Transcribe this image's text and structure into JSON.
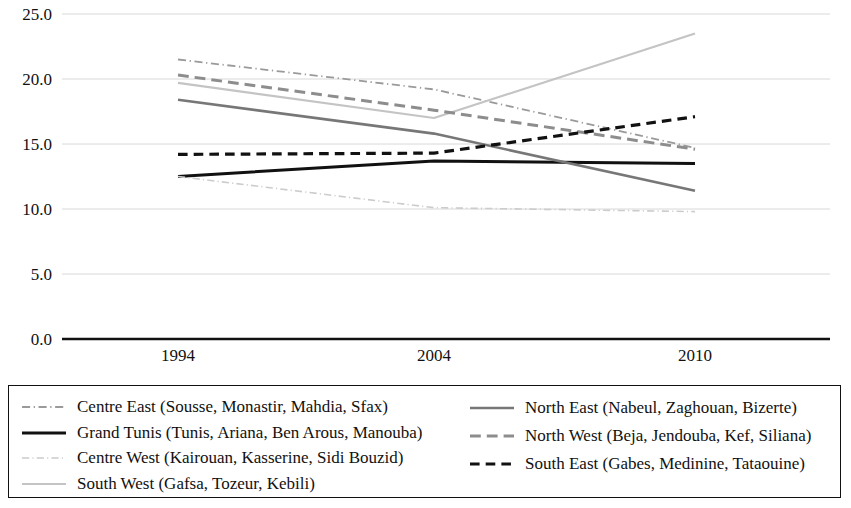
{
  "chart_data": {
    "type": "line",
    "title": "",
    "subtitle": "",
    "xlabel": "",
    "ylabel": "",
    "x": [
      "1994",
      "2004",
      "2010"
    ],
    "categories": [
      "1994",
      "2004",
      "2010"
    ],
    "xtick_labels": [
      "1994",
      "2004",
      "2010"
    ],
    "ytick_labels": [
      "0.0",
      "5.0",
      "10.0",
      "15.0",
      "20.0",
      "25.0"
    ],
    "yticks": [
      0.0,
      5.0,
      10.0,
      15.0,
      20.0,
      25.0
    ],
    "ylim": [
      0.0,
      25.0
    ],
    "grid": true,
    "grid_axis": "y",
    "legend_position": "bottom",
    "legend_columns": 2,
    "series": [
      {
        "name": "Centre East (Sousse, Monastir, Mahdia, Sfax)",
        "short_name": "Centre East",
        "values": [
          21.5,
          19.2,
          14.7
        ],
        "style": "dash-dot",
        "color": "#9a9a9a",
        "width": 1.8
      },
      {
        "name": "Grand Tunis (Tunis, Ariana, Ben Arous, Manouba)",
        "short_name": "Grand Tunis",
        "values": [
          12.5,
          13.7,
          13.5
        ],
        "style": "solid",
        "color": "#111111",
        "width": 3.0
      },
      {
        "name": "Centre West (Kairouan, Kasserine, Sidi Bouzid)",
        "short_name": "Centre West",
        "values": [
          12.5,
          10.1,
          9.8
        ],
        "style": "dash-dot",
        "color": "#cccccc",
        "width": 1.6
      },
      {
        "name": "South West (Gafsa, Tozeur, Kebili)",
        "short_name": "South West",
        "values": [
          19.7,
          17.0,
          23.5
        ],
        "style": "solid",
        "color": "#c4c4c4",
        "width": 2.2
      },
      {
        "name": "North East (Nabeul, Zaghouan, Bizerte)",
        "short_name": "North East",
        "values": [
          18.4,
          15.8,
          11.4
        ],
        "style": "solid",
        "color": "#777777",
        "width": 2.6
      },
      {
        "name": "North West (Beja, Jendouba, Kef, Siliana)",
        "short_name": "North West",
        "values": [
          20.3,
          17.6,
          14.6
        ],
        "style": "long-dash",
        "color": "#8d8d8d",
        "width": 3.0
      },
      {
        "name": "South East (Gabes, Medinine, Tataouine)",
        "short_name": "South East",
        "values": [
          14.2,
          14.3,
          17.1
        ],
        "style": "dashed",
        "color": "#111111",
        "width": 3.2
      }
    ]
  },
  "legend": {
    "left_items": [
      "Centre East (Sousse, Monastir, Mahdia, Sfax)",
      "Grand Tunis (Tunis, Ariana, Ben Arous, Manouba)",
      "Centre West (Kairouan, Kasserine, Sidi Bouzid)",
      "South West (Gafsa, Tozeur, Kebili)"
    ],
    "right_items": [
      "North East (Nabeul, Zaghouan, Bizerte)",
      "North West (Beja, Jendouba, Kef, Siliana)",
      "South East (Gabes, Medinine, Tataouine)"
    ]
  }
}
